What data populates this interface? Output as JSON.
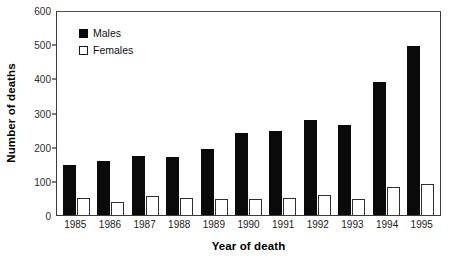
{
  "chart_data": {
    "type": "bar",
    "title": "",
    "subtitle": "",
    "xlabel": "Year of death",
    "ylabel": "Number of deaths",
    "categories": [
      "1985",
      "1986",
      "1987",
      "1988",
      "1989",
      "1990",
      "1991",
      "1992",
      "1993",
      "1994",
      "1995"
    ],
    "series": [
      {
        "name": "Males",
        "color": "#0a0a0a",
        "values": [
          145,
          157,
          173,
          170,
          192,
          240,
          247,
          277,
          262,
          390,
          495
        ]
      },
      {
        "name": "Females",
        "color": "#ffffff",
        "values": [
          50,
          38,
          55,
          50,
          47,
          47,
          50,
          58,
          48,
          82,
          92
        ]
      }
    ],
    "ylim": [
      0,
      600
    ],
    "ytick_values": [
      0,
      100,
      200,
      300,
      400,
      500,
      600
    ],
    "ytick_labels": [
      "0",
      "100",
      "200",
      "300",
      "400",
      "500",
      "600"
    ],
    "grid": false,
    "legend_position": "upper-left-inside",
    "frame": true
  },
  "legend": {
    "entries": [
      {
        "label": "Males",
        "swatch": "filled-black-square"
      },
      {
        "label": "Females",
        "swatch": "open-white-square"
      }
    ]
  }
}
